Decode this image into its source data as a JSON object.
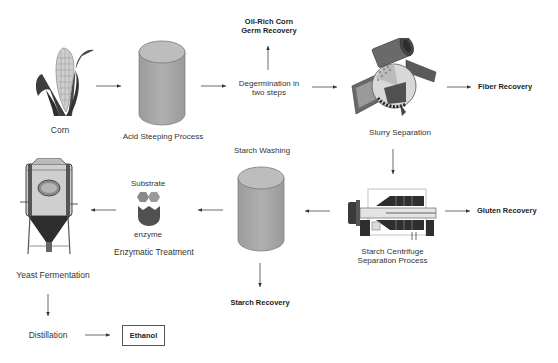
{
  "diagram": {
    "nodes": {
      "corn": {
        "label": "Corn",
        "icon": "corn-cob-icon"
      },
      "acid_steeping": {
        "label": "Acid Steeping Process",
        "icon": "cylinder-tank-icon"
      },
      "degermination": {
        "label_line1": "Degermination in",
        "label_line2": "two steps"
      },
      "germ_recovery": {
        "label_line1": "Oil-Rich Corn",
        "label_line2": "Germ Recovery"
      },
      "slurry_separation": {
        "label": "Slurry Separation",
        "icon": "slurry-separator-machine-icon"
      },
      "fiber_recovery": {
        "label": "Fiber Recovery"
      },
      "centrifuge": {
        "label_line1": "Starch Centrifuge",
        "label_line2": "Separation Process",
        "icon": "centrifuge-machine-icon"
      },
      "gluten_recovery": {
        "label": "Gluten Recovery"
      },
      "starch_washing": {
        "label": "Starch Washing",
        "icon": "cylinder-tank-icon"
      },
      "starch_recovery": {
        "label": "Starch Recovery"
      },
      "enzymatic_treatment": {
        "label": "Enzymatic Treatment",
        "substrate_label": "Substrate",
        "enzyme_label": "enzyme",
        "icon": "substrate-enzyme-icon"
      },
      "yeast_fermentation": {
        "label": "Yeast Fermentation",
        "icon": "fermenter-tank-icon"
      },
      "distillation": {
        "label": "Distillation"
      },
      "ethanol": {
        "label": "Ethanol"
      }
    },
    "edges": [
      [
        "Corn",
        "Acid Steeping Process"
      ],
      [
        "Acid Steeping Process",
        "Degermination in two steps"
      ],
      [
        "Degermination in two steps",
        "Oil-Rich Corn Germ Recovery"
      ],
      [
        "Degermination in two steps",
        "Slurry Separation"
      ],
      [
        "Slurry Separation",
        "Fiber Recovery"
      ],
      [
        "Slurry Separation",
        "Starch Centrifuge Separation Process"
      ],
      [
        "Starch Centrifuge Separation Process",
        "Gluten Recovery"
      ],
      [
        "Starch Centrifuge Separation Process",
        "Starch Washing"
      ],
      [
        "Starch Washing",
        "Starch Recovery"
      ],
      [
        "Starch Washing",
        "Enzymatic Treatment"
      ],
      [
        "Enzymatic Treatment",
        "Yeast Fermentation"
      ],
      [
        "Yeast Fermentation",
        "Distillation"
      ],
      [
        "Distillation",
        "Ethanol"
      ]
    ],
    "colors": {
      "cylinder_fill": "#a9a9a9",
      "cylinder_top": "#b8b8b8",
      "arrow": "#333333",
      "enzyme": "#555555",
      "substrate": "#888888"
    }
  }
}
